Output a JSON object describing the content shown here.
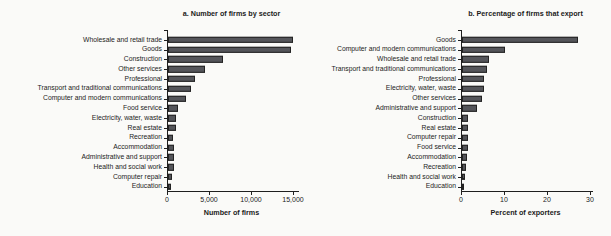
{
  "figure": {
    "background": "#fafaf8",
    "text_color": "#1a1a1a",
    "axis_color": "#1f1f1f",
    "bar_fill": "#54555a",
    "bar_stroke": "#232323"
  },
  "chart_data": [
    {
      "type": "bar",
      "orientation": "horizontal",
      "title": "a. Number of firms by sector",
      "xlabel": "Number of firms",
      "ylabel": "",
      "xlim": [
        0,
        15000
      ],
      "xticks": [
        0,
        5000,
        10000,
        15000
      ],
      "xtick_labels": [
        "0",
        "5,000",
        "10,000",
        "15,000"
      ],
      "grid": false,
      "legend": "none",
      "categories": [
        "Wholesale and retail trade",
        "Goods",
        "Construction",
        "Other services",
        "Professional",
        "Transport and traditional communications",
        "Computer and modern communications",
        "Food service",
        "Electricity, water, waste",
        "Real estate",
        "Recreation",
        "Accommodation",
        "Administrative and support",
        "Health and social work",
        "Computer repair",
        "Education"
      ],
      "values": [
        14900,
        14700,
        6500,
        4400,
        3200,
        2700,
        2100,
        1200,
        1000,
        900,
        650,
        750,
        700,
        750,
        500,
        400
      ]
    },
    {
      "type": "bar",
      "orientation": "horizontal",
      "title": "b. Percentage of firms that export",
      "xlabel": "Percent of exporters",
      "ylabel": "",
      "xlim": [
        0,
        30
      ],
      "xticks": [
        0,
        10,
        20,
        30
      ],
      "xtick_labels": [
        "0",
        "10",
        "20",
        "30"
      ],
      "grid": false,
      "legend": "none",
      "categories": [
        "Goods",
        "Computer and modern communications",
        "Wholesale and retail trade",
        "Transport and traditional communications",
        "Professional",
        "Electricity, water, waste",
        "Other services",
        "Administrative and support",
        "Construction",
        "Real estate",
        "Computer repair",
        "Food service",
        "Accommodation",
        "Recreation",
        "Health and social work",
        "Education"
      ],
      "values": [
        27,
        10,
        6.2,
        5.8,
        5.2,
        5.0,
        4.6,
        3.6,
        1.5,
        1.5,
        1.4,
        1.5,
        1.1,
        1.0,
        0.8,
        0.3
      ]
    }
  ]
}
